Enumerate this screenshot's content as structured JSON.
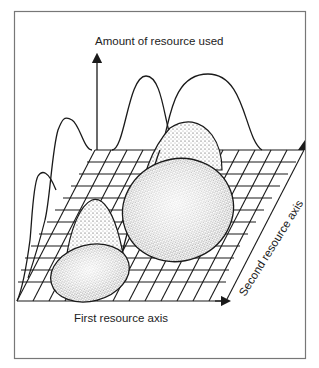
{
  "figure": {
    "vertical_axis_label": "Amount of resource used",
    "first_axis_label": "First resource axis",
    "second_axis_label": "Second resource axis",
    "colors": {
      "ink": "#1a1a1a",
      "frame": "#777777",
      "background": "#ffffff"
    },
    "elements": {
      "grid": "resource-plane-grid",
      "niches": [
        "small-species-niche-ellipse",
        "large-species-niche-ellipse"
      ],
      "projections": [
        "bell-curves-on-first-axis-wall",
        "bell-curves-on-second-axis-wall"
      ]
    }
  }
}
